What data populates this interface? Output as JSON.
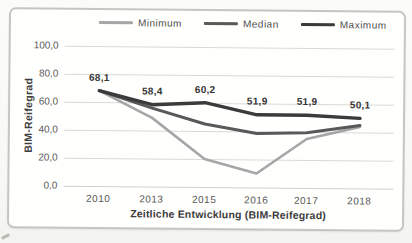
{
  "chart_data": {
    "type": "line",
    "title": "",
    "xlabel": "Zeitliche Entwicklung (BIM-Reifegrad)",
    "ylabel": "BIM-Reifegrad",
    "categories": [
      "2010",
      "2013",
      "2015",
      "2016",
      "2017",
      "2018"
    ],
    "series": [
      {
        "name": "Minimum",
        "color": "#a6a6a6",
        "stroke_width": 2.6,
        "values": [
          68.1,
          49,
          20,
          10,
          35,
          44
        ]
      },
      {
        "name": "Median",
        "color": "#595959",
        "stroke_width": 3,
        "values": [
          68.1,
          56,
          45,
          38.5,
          39.5,
          45
        ]
      },
      {
        "name": "Maximum",
        "color": "#3b3b3b",
        "stroke_width": 3.4,
        "values": [
          68.1,
          58.4,
          60.2,
          51.9,
          51.9,
          50.1
        ],
        "point_labels": [
          "68,1",
          "58,4",
          "60,2",
          "51,9",
          "51,9",
          "50,1"
        ]
      }
    ],
    "ylim": [
      0,
      100
    ],
    "ytick_labels": [
      "100,0",
      "80,0",
      "60,0",
      "40,0",
      "20,0",
      "0,0"
    ],
    "grid": true,
    "legend_position": "top",
    "gridline_color": "#d9d9d7"
  }
}
